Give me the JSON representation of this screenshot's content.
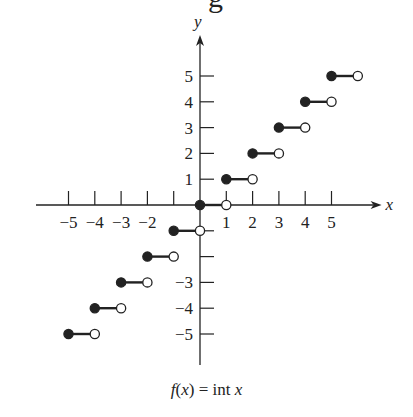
{
  "title_fragment": "g",
  "caption": {
    "fx": "f",
    "paren_open": "(",
    "x1": "x",
    "rest": ") = int ",
    "x2": "x"
  },
  "chart_data": {
    "type": "step",
    "title": "",
    "function": "f(x) = int x",
    "xlabel": "x",
    "ylabel": "y",
    "xlim": [
      -6,
      6.5
    ],
    "ylim": [
      -6,
      6.5
    ],
    "grid": false,
    "x_ticks": [
      -5,
      -4,
      -3,
      -2,
      -1,
      1,
      2,
      3,
      4,
      5
    ],
    "x_tick_labels": [
      "-5",
      "-4",
      "-3",
      "-2",
      "",
      "1",
      "2",
      "3",
      "4",
      "5"
    ],
    "y_ticks": [
      -5,
      -4,
      -3,
      -2,
      -1,
      1,
      2,
      3,
      4,
      5
    ],
    "y_tick_labels": [
      "-5",
      "-4",
      "-3",
      "",
      "",
      "1",
      "2",
      "3",
      "4",
      "5"
    ],
    "segments": [
      {
        "x_start": -5,
        "x_end": -4,
        "y": -5,
        "start": "closed",
        "end": "open"
      },
      {
        "x_start": -4,
        "x_end": -3,
        "y": -4,
        "start": "closed",
        "end": "open"
      },
      {
        "x_start": -3,
        "x_end": -2,
        "y": -3,
        "start": "closed",
        "end": "open"
      },
      {
        "x_start": -2,
        "x_end": -1,
        "y": -2,
        "start": "closed",
        "end": "open"
      },
      {
        "x_start": -1,
        "x_end": 0,
        "y": -1,
        "start": "closed",
        "end": "open"
      },
      {
        "x_start": 0,
        "x_end": 1,
        "y": 0,
        "start": "closed",
        "end": "open"
      },
      {
        "x_start": 1,
        "x_end": 2,
        "y": 1,
        "start": "closed",
        "end": "open"
      },
      {
        "x_start": 2,
        "x_end": 3,
        "y": 2,
        "start": "closed",
        "end": "open"
      },
      {
        "x_start": 3,
        "x_end": 4,
        "y": 3,
        "start": "closed",
        "end": "open"
      },
      {
        "x_start": 4,
        "x_end": 5,
        "y": 4,
        "start": "closed",
        "end": "open"
      },
      {
        "x_start": 5,
        "x_end": 6,
        "y": 5,
        "start": "closed",
        "end": "open"
      }
    ]
  },
  "style": {
    "ink": "#222222",
    "background": "#ffffff"
  }
}
